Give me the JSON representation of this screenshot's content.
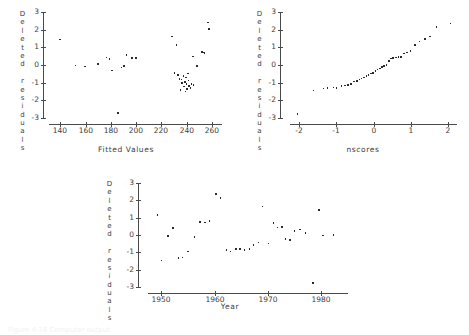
{
  "figure": {
    "background": "#ffffff",
    "ink": "#3d3d3d",
    "point_color": "#2a2a2a",
    "caption": "Figure 4-16  Computer output",
    "panel_count": 3
  },
  "chart_data": [
    {
      "id": "residuals-vs-fitted",
      "type": "scatter",
      "title": "",
      "xlabel": "Fitted Values",
      "ylabel": "Deleted residuals",
      "ylabel_chars": [
        "D",
        "e",
        "l",
        "e",
        "t",
        "e",
        "d",
        "",
        "r",
        "e",
        "s",
        "i",
        "d",
        "u",
        "a",
        "l",
        "s"
      ],
      "xticks": [
        140,
        160,
        180,
        200,
        220,
        240,
        260
      ],
      "xtick_labels": [
        "140",
        "160",
        "180",
        "200",
        "220",
        "240",
        "260"
      ],
      "yticks": [
        3,
        2,
        1,
        0,
        -1,
        -2,
        -3
      ],
      "ytick_labels": [
        "3",
        "2",
        "1",
        "0",
        "-1",
        "-2",
        "-3"
      ],
      "xlim": [
        131,
        268
      ],
      "ylim": [
        -3.4,
        3.0
      ],
      "grid": false,
      "legend": "none",
      "points": [
        [
          139.5,
          1.45
        ],
        [
          152.0,
          -0.02
        ],
        [
          159.5,
          -0.08
        ],
        [
          170.0,
          0.05
        ],
        [
          176.5,
          0.42
        ],
        [
          179.0,
          0.35
        ],
        [
          181.0,
          -0.32
        ],
        [
          185.5,
          -2.72
        ],
        [
          188.5,
          -0.14
        ],
        [
          190.5,
          -0.07
        ],
        [
          192.5,
          0.55
        ],
        [
          196.5,
          0.38
        ],
        [
          200.0,
          0.4
        ],
        [
          228.5,
          1.62
        ],
        [
          230.5,
          -0.44
        ],
        [
          232.0,
          1.12
        ],
        [
          233.0,
          -0.55
        ],
        [
          234.5,
          -0.78
        ],
        [
          235.0,
          -1.42
        ],
        [
          236.0,
          -0.83
        ],
        [
          236.5,
          -1.02
        ],
        [
          237.5,
          -0.62
        ],
        [
          238.0,
          -1.22
        ],
        [
          238.5,
          -0.95
        ],
        [
          239.0,
          -1.5
        ],
        [
          239.5,
          -0.7
        ],
        [
          240.0,
          -1.08
        ],
        [
          240.5,
          -1.35
        ],
        [
          241.0,
          -0.48
        ],
        [
          241.5,
          -0.88
        ],
        [
          242.0,
          -1.18
        ],
        [
          243.0,
          -1.3
        ],
        [
          244.0,
          -1.07
        ],
        [
          245.0,
          0.48
        ],
        [
          245.5,
          -1.12
        ],
        [
          248.0,
          -0.05
        ],
        [
          252.0,
          0.72
        ],
        [
          253.0,
          0.7
        ],
        [
          254.0,
          0.68
        ],
        [
          257.0,
          2.4
        ],
        [
          257.5,
          2.05
        ]
      ]
    },
    {
      "id": "normal-probability-plot",
      "type": "scatter",
      "title": "",
      "xlabel": "nscores",
      "ylabel": "Deleted residuals",
      "ylabel_chars": [
        "D",
        "e",
        "l",
        "e",
        "t",
        "e",
        "d",
        "",
        "r",
        "e",
        "s",
        "i",
        "d",
        "u",
        "a",
        "l",
        "s"
      ],
      "xticks": [
        -2,
        -1,
        0,
        1,
        2
      ],
      "xtick_labels": [
        "-2",
        "-1",
        "0",
        "1",
        "2"
      ],
      "yticks": [
        3,
        2,
        1,
        0,
        -1,
        -2,
        -3
      ],
      "ytick_labels": [
        "3",
        "2",
        "1",
        "0",
        "-1",
        "-2",
        "-3"
      ],
      "xlim": [
        -2.25,
        2.25
      ],
      "ylim": [
        -3.4,
        3.0
      ],
      "grid": false,
      "legend": "none",
      "points": [
        [
          -2.05,
          -2.78
        ],
        [
          -1.62,
          -1.45
        ],
        [
          -1.35,
          -1.32
        ],
        [
          -1.24,
          -1.3
        ],
        [
          -1.08,
          -1.28
        ],
        [
          -1.0,
          -1.3
        ],
        [
          -0.86,
          -1.2
        ],
        [
          -0.76,
          -1.15
        ],
        [
          -0.68,
          -1.12
        ],
        [
          -0.6,
          -1.06
        ],
        [
          -0.52,
          -0.94
        ],
        [
          -0.45,
          -0.9
        ],
        [
          -0.38,
          -0.82
        ],
        [
          -0.32,
          -0.76
        ],
        [
          -0.25,
          -0.7
        ],
        [
          -0.19,
          -0.62
        ],
        [
          -0.13,
          -0.56
        ],
        [
          -0.07,
          -0.48
        ],
        [
          -0.01,
          -0.44
        ],
        [
          0.05,
          -0.34
        ],
        [
          0.11,
          -0.26
        ],
        [
          0.17,
          -0.2
        ],
        [
          0.23,
          -0.12
        ],
        [
          0.29,
          -0.06
        ],
        [
          0.35,
          0.0
        ],
        [
          0.41,
          0.22
        ],
        [
          0.47,
          0.36
        ],
        [
          0.53,
          0.4
        ],
        [
          0.6,
          0.42
        ],
        [
          0.67,
          0.44
        ],
        [
          0.74,
          0.46
        ],
        [
          0.82,
          0.64
        ],
        [
          0.91,
          0.7
        ],
        [
          1.0,
          0.78
        ],
        [
          1.12,
          1.12
        ],
        [
          1.24,
          1.34
        ],
        [
          1.38,
          1.46
        ],
        [
          1.52,
          1.62
        ],
        [
          1.7,
          2.16
        ],
        [
          2.08,
          2.36
        ]
      ]
    },
    {
      "id": "residuals-vs-year",
      "type": "scatter",
      "title": "",
      "xlabel": "Year",
      "ylabel": "Deleted residuals",
      "ylabel_chars": [
        "D",
        "e",
        "l",
        "e",
        "t",
        "e",
        "d",
        "",
        "r",
        "e",
        "s",
        "i",
        "d",
        "u",
        "a",
        "l",
        "s"
      ],
      "xticks": [
        1950,
        1960,
        1970,
        1980
      ],
      "xtick_labels": [
        "1950",
        "1960",
        "1970",
        "1980"
      ],
      "yticks": [
        3,
        2,
        1,
        0,
        -1,
        -2,
        -3
      ],
      "ytick_labels": [
        "3",
        "2",
        "1",
        "0",
        "-1",
        "-2",
        "-3"
      ],
      "xlim": [
        1947.5,
        1985.0
      ],
      "ylim": [
        -3.4,
        3.0
      ],
      "grid": false,
      "legend": "none",
      "points": [
        [
          1949.3,
          1.16
        ],
        [
          1950.0,
          -1.48
        ],
        [
          1951.2,
          -0.06
        ],
        [
          1952.2,
          0.42
        ],
        [
          1953.2,
          -1.32
        ],
        [
          1954.0,
          -1.3
        ],
        [
          1955.0,
          -0.96
        ],
        [
          1956.2,
          -0.1
        ],
        [
          1957.3,
          0.76
        ],
        [
          1958.2,
          0.72
        ],
        [
          1959.0,
          0.8
        ],
        [
          1960.2,
          2.36
        ],
        [
          1961.1,
          2.14
        ],
        [
          1962.2,
          -0.86
        ],
        [
          1963.0,
          -0.96
        ],
        [
          1964.0,
          -0.82
        ],
        [
          1964.8,
          -0.8
        ],
        [
          1965.6,
          -0.88
        ],
        [
          1966.5,
          -0.8
        ],
        [
          1967.3,
          -0.56
        ],
        [
          1968.2,
          -0.44
        ],
        [
          1969.0,
          1.65
        ],
        [
          1970.1,
          -0.5
        ],
        [
          1971.0,
          0.68
        ],
        [
          1971.8,
          0.44
        ],
        [
          1972.6,
          0.46
        ],
        [
          1973.3,
          -0.22
        ],
        [
          1974.1,
          -0.3
        ],
        [
          1975.0,
          0.24
        ],
        [
          1976.0,
          0.32
        ],
        [
          1977.0,
          0.1
        ],
        [
          1978.4,
          -2.78
        ],
        [
          1979.6,
          1.44
        ],
        [
          1980.3,
          -0.02
        ],
        [
          1982.3,
          0.0
        ]
      ]
    }
  ]
}
